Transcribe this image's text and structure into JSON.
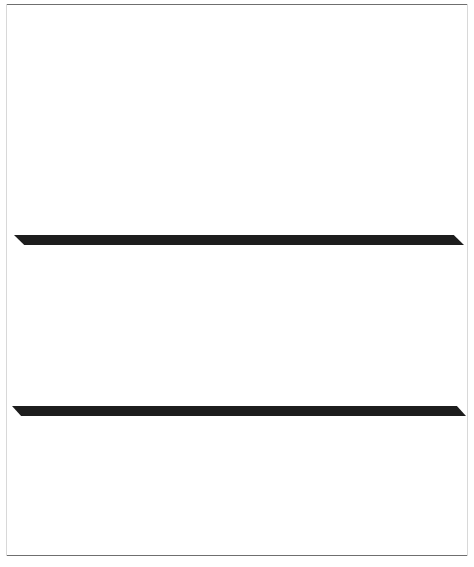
{
  "chart_data": [
    {
      "id": "time-of-day",
      "type": "bar",
      "title": "",
      "xlabel": "",
      "ylabel": "",
      "ylim": [
        0,
        55
      ],
      "grid": false,
      "legend": "none",
      "value_suffix": "%",
      "categories": [
        "Daytime\n(6 A.M.–6 P.M.)",
        "Total\nnighttime\n(6 A.M.–6 P.M.)",
        "6 P.M.–midnight",
        "Nighttime\n(midnight–6 A.M.)",
        "Not known\nNot available"
      ],
      "category_lines": [
        [
          {
            "t": "Daytime",
            "small": false
          },
          {
            "t": "(6 ",
            "small": false
          }
        ],
        [
          {
            "t": "Total",
            "small": false
          }
        ],
        [
          {
            "t": "6 ",
            "small": false
          }
        ],
        [
          {
            "t": "Nighttime",
            "small": false
          }
        ],
        [
          {
            "t": "Not known",
            "small": false
          }
        ]
      ],
      "values": [
        48.0,
        51.5,
        36.9,
        13.8,
        0.6
      ],
      "value_labels": [
        "48.0%",
        "51.5%",
        "36.9%",
        "13.8%",
        "0.6%"
      ]
    },
    {
      "id": "location",
      "type": "bar",
      "title": "",
      "xlabel": "",
      "ylabel": "",
      "ylim": [
        0,
        27
      ],
      "grid": false,
      "legend": "none",
      "value_suffix": "%",
      "categories": [
        "At or in\nrespondents' home",
        "Near home",
        "On street near home",
        "At, in, near home of\nfriend, relative, neighbor",
        "On street near home of\nfriend, relative, neighbor",
        "Inside restaurant,\nbar, nightclub",
        "In other commercial building",
        "In parking lot or garage",
        "Inside school building",
        "On school property",
        "In apartment, yard, park,\nfield, playground",
        "On street not near own\nhome or friends' home",
        "On public transportation",
        "Other"
      ],
      "values": [
        12.0,
        7.3,
        4.3,
        7.4,
        1.2,
        4.9,
        5.5,
        8.5,
        6.2,
        5.9,
        4.9,
        24.3,
        1.4,
        6.1
      ],
      "value_labels": [
        "12.0%",
        "7.3%",
        "4.3%",
        "7.4%",
        "1.2%",
        "4.9%",
        "5.5%",
        "8.5%",
        "6.2%",
        "5.9%",
        "4.9%",
        "24.3%",
        "1.4%",
        "6.1%"
      ]
    }
  ],
  "style": {
    "bar_fill": "#c9c9c9",
    "bar_shadow": "#2b2b2b",
    "baseline": "#1d1d1d",
    "rule": "#6f6f6f",
    "text": "#111111"
  },
  "labels_top": [
    {
      "l1": "Daytime",
      "l2": "(6 A.M.–6 P.M.)",
      "l3": ""
    },
    {
      "l1": "Total",
      "l2": "nighttime",
      "l3": "(6 A.M.–6 P.M.)"
    },
    {
      "l1": "6 P.M.–midnight",
      "l2": "",
      "l3": ""
    },
    {
      "l1": "Nighttime",
      "l2": "(midnight–6 A.M.)",
      "l3": ""
    },
    {
      "l1": "Not known",
      "l2": "Not available",
      "l3": ""
    }
  ]
}
